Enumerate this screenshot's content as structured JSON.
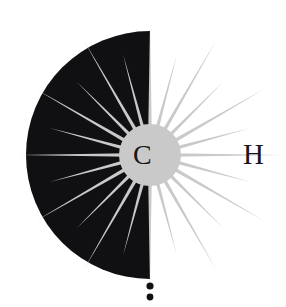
{
  "artwork": {
    "title": "CH starburst compass mark",
    "background_color": "#ffffff",
    "letters": [
      {
        "name": "letter-c",
        "text": "C",
        "color": "#17171a",
        "x": 145,
        "y": 155
      },
      {
        "name": "letter-h",
        "text": "H",
        "color": "#17171a",
        "x": 254,
        "y": 155
      }
    ],
    "semicircle": {
      "name": "black-half-disc",
      "fill": "#100f12",
      "center_x": 150,
      "center_y": 155,
      "radius": 124,
      "side": "left",
      "start_angle": 90,
      "end_angle": 270
    },
    "starburst": {
      "name": "starburst-rays",
      "fill": "#c9c9ca",
      "center_x": 150,
      "center_y": 155,
      "ray_count": 24,
      "long_ray_length": 132,
      "short_ray_length": 104,
      "core_radius": 31,
      "ray_half_width_deg": 4.6,
      "rotation_offset_deg": 0
    },
    "dots": [
      {
        "name": "dot-upper",
        "cx": 150,
        "cy": 286,
        "r": 3.6,
        "fill": "#111114"
      },
      {
        "name": "dot-lower",
        "cx": 150,
        "cy": 297,
        "r": 3.4,
        "fill": "#111114"
      }
    ],
    "colors": {
      "ink_black": "#100f12",
      "ray_gray": "#c9c9ca",
      "paper_white": "#ffffff",
      "letter_ink": "#17171a"
    }
  }
}
